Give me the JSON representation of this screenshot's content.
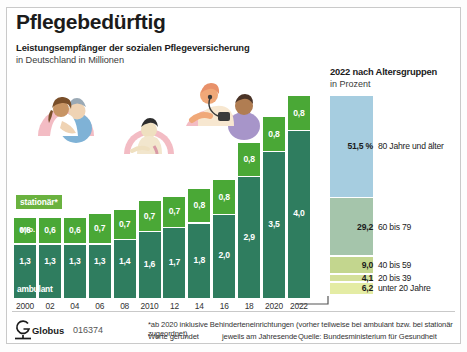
{
  "header": {
    "title": "Pflegebedürftig",
    "subtitle": "Leistungsempfänger der sozialen Pflegeversicherung",
    "subtitle2": "in Deutschland in Millionen"
  },
  "labels": {
    "stationaer_badge": "stationär*",
    "mio": "Mio.",
    "ambulant": "ambulant"
  },
  "age_panel": {
    "title": "2022 nach Altersgruppen",
    "subtitle": "in Prozent"
  },
  "footer": {
    "logo_name": "Globus",
    "logo_number": "016374",
    "note1": "*ab 2020 inklusive Behinderteneinrichtungen (vorher teilweise bei ambulant bzw. bei stationär zugeordnet)",
    "note2": "Werte gerundet",
    "note3": "jeweils am Jahresende",
    "source": "Quelle: Bundesministerium für Gesundheit"
  },
  "colors": {
    "ambulant": "#2f7d5f",
    "stationaer": "#4aa836",
    "age_80plus": "#a6cde0",
    "age_60_79": "#a5c5ab",
    "age_40_59": "#c3d68e",
    "age_20_39": "#d4e09a",
    "age_under20": "#e4eca4"
  },
  "chart_data": {
    "type": "bar",
    "title": "Leistungsempfänger der sozialen Pflegeversicherung",
    "subtitle": "in Deutschland in Millionen",
    "xlabel": "",
    "ylabel": "Millionen",
    "ylim": [
      0,
      5.0
    ],
    "grid": false,
    "legend": [
      "stationär*",
      "ambulant"
    ],
    "legend_position": "in-bars",
    "categories": [
      "2000",
      "02",
      "04",
      "06",
      "08",
      "2010",
      "12",
      "14",
      "16",
      "18",
      "2020",
      "2022"
    ],
    "series": [
      {
        "name": "ambulant",
        "values": [
          1.3,
          1.3,
          1.3,
          1.3,
          1.4,
          1.6,
          1.7,
          1.8,
          2.0,
          2.9,
          3.5,
          4.0
        ]
      },
      {
        "name": "stationär",
        "values": [
          0.6,
          0.6,
          0.6,
          0.7,
          0.7,
          0.7,
          0.7,
          0.8,
          0.8,
          0.8,
          0.8,
          0.8
        ]
      }
    ],
    "value_labels": {
      "ambulant": [
        "1,3",
        "1,3",
        "1,3",
        "1,3",
        "1,4",
        "1,6",
        "1,7",
        "1,8",
        "2,0",
        "2,9",
        "3,5",
        "4,0"
      ],
      "stationaer": [
        "0,6",
        "0,6",
        "0,6",
        "0,7",
        "0,7",
        "0,7",
        "0,7",
        "0,8",
        "0,8",
        "0,8",
        "0,8",
        "0,8"
      ]
    },
    "secondary": {
      "type": "bar",
      "title": "2022 nach Altersgruppen",
      "subtitle": "in Prozent",
      "categories": [
        "80 Jahre und älter",
        "60 bis 79",
        "40 bis 59",
        "20 bis 39",
        "unter 20 Jahre"
      ],
      "values": [
        51.5,
        29.2,
        9.0,
        4.1,
        6.2
      ],
      "value_labels": [
        "51,5 %",
        "29,2",
        "9,0",
        "4,1",
        "6,2"
      ],
      "ylim": [
        0,
        100
      ]
    }
  }
}
